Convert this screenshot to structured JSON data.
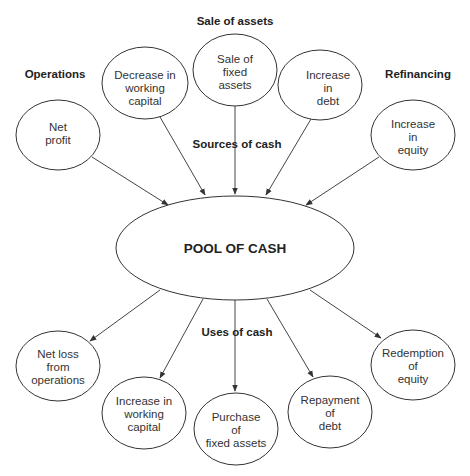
{
  "diagram": {
    "center": {
      "label": "POOL OF CASH"
    },
    "group_labels": {
      "operations": "Operations",
      "sale_of_assets": "Sale of assets",
      "refinancing": "Refinancing",
      "sources": "Sources of cash",
      "uses": "Uses of cash"
    },
    "sources": [
      {
        "id": "net-profit",
        "lines": [
          "Net",
          "profit"
        ]
      },
      {
        "id": "decrease-working-capital",
        "lines": [
          "Decrease in",
          "working",
          "capital"
        ]
      },
      {
        "id": "sale-fixed-assets",
        "lines": [
          "Sale of",
          "fixed",
          "assets"
        ]
      },
      {
        "id": "increase-debt",
        "lines": [
          "Increase",
          "in",
          "debt"
        ]
      },
      {
        "id": "increase-equity",
        "lines": [
          "Increase",
          "in",
          "equity"
        ]
      }
    ],
    "uses": [
      {
        "id": "net-loss-operations",
        "lines": [
          "Net loss",
          "from",
          "operations"
        ]
      },
      {
        "id": "increase-working-capital",
        "lines": [
          "Increase in",
          "working",
          "capital"
        ]
      },
      {
        "id": "purchase-fixed-assets",
        "lines": [
          "Purchase",
          "of",
          "fixed assets"
        ]
      },
      {
        "id": "repayment-debt",
        "lines": [
          "Repayment",
          "of",
          "debt"
        ]
      },
      {
        "id": "redemption-equity",
        "lines": [
          "Redemption",
          "of",
          "equity"
        ]
      }
    ],
    "colors": {
      "stroke": "#333333",
      "text": "#333333",
      "background": "#ffffff"
    }
  }
}
